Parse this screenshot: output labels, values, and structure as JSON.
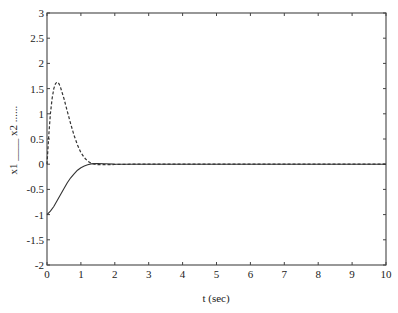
{
  "chart_data": {
    "type": "line",
    "title": "",
    "xlabel": "t (sec)",
    "ylabel": "x1 ____ x2 ......",
    "xlim": [
      0,
      10
    ],
    "ylim": [
      -2,
      3
    ],
    "x_ticks": [
      "0",
      "1",
      "2",
      "3",
      "4",
      "5",
      "6",
      "7",
      "8",
      "9",
      "10"
    ],
    "y_ticks": [
      "-2",
      "-1.5",
      "-1",
      "-0.5",
      "0",
      "0.5",
      "1",
      "1.5",
      "2",
      "2.5",
      "3"
    ],
    "grid": false,
    "legend": "encoded in y-axis label (x1 solid, x2 dotted)",
    "series": [
      {
        "name": "x1",
        "style": "solid",
        "x": [
          0,
          0.1,
          0.2,
          0.3,
          0.4,
          0.5,
          0.6,
          0.7,
          0.8,
          0.9,
          1.0,
          1.1,
          1.2,
          1.3,
          1.4,
          1.5,
          1.7,
          2.0,
          2.5,
          3,
          4,
          5,
          6,
          7,
          8,
          9,
          10
        ],
        "y": [
          -1.0,
          -0.93,
          -0.84,
          -0.72,
          -0.6,
          -0.48,
          -0.37,
          -0.27,
          -0.19,
          -0.12,
          -0.07,
          -0.035,
          -0.01,
          0.005,
          0.012,
          0.012,
          0.008,
          0.002,
          0.0,
          0.0,
          0.0,
          0.0,
          0.0,
          0.0,
          0.0,
          0.0,
          0.0
        ]
      },
      {
        "name": "x2",
        "style": "dotted",
        "x": [
          0,
          0.05,
          0.1,
          0.15,
          0.2,
          0.25,
          0.3,
          0.35,
          0.4,
          0.5,
          0.6,
          0.7,
          0.8,
          0.9,
          1.0,
          1.1,
          1.2,
          1.3,
          1.4,
          1.5,
          1.7,
          2.0,
          2.5,
          3,
          4,
          5,
          6,
          7,
          8,
          9,
          10
        ],
        "y": [
          0.0,
          0.55,
          1.0,
          1.3,
          1.5,
          1.6,
          1.63,
          1.6,
          1.52,
          1.3,
          1.05,
          0.8,
          0.57,
          0.38,
          0.23,
          0.13,
          0.06,
          0.02,
          0.0,
          -0.01,
          -0.01,
          -0.005,
          0.0,
          0.0,
          0.0,
          0.0,
          0.0,
          0.0,
          0.0,
          0.0,
          0.0
        ]
      }
    ],
    "caption": "Fig. ... (caption cut off at bottom edge)"
  },
  "layout": {
    "plot_left_px": 47,
    "plot_right_px": 386,
    "plot_top_px": 13,
    "plot_bottom_px": 265,
    "line_color": "#333333",
    "axis_color": "#444444"
  }
}
